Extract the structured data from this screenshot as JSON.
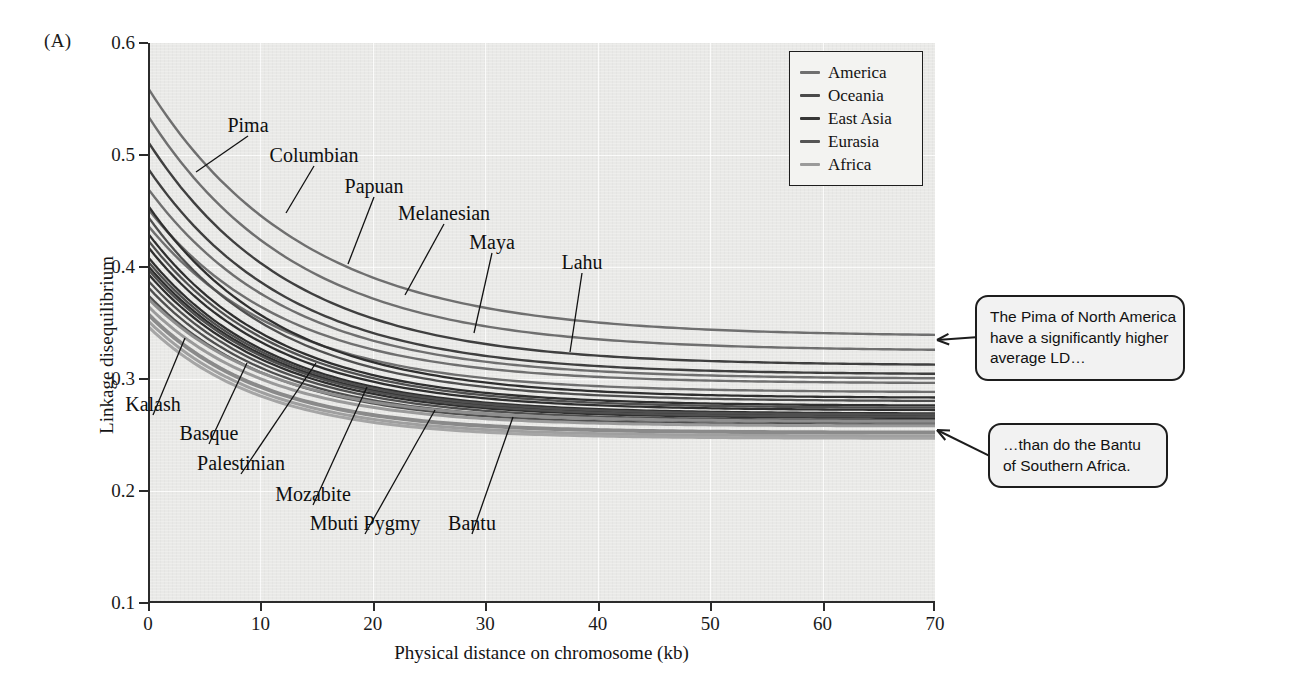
{
  "panel": {
    "letter": "(A)"
  },
  "chart_data": {
    "type": "line",
    "title": "",
    "xlabel": "Physical distance on chromosome (kb)",
    "ylabel": "Linkage disequilibrium",
    "xlim": [
      0,
      70
    ],
    "ylim": [
      0.1,
      0.6
    ],
    "xticks": [
      "0",
      "10",
      "20",
      "30",
      "40",
      "50",
      "60",
      "70"
    ],
    "xtick_values": [
      0,
      10,
      20,
      30,
      40,
      50,
      60,
      70
    ],
    "yticks": [
      "0.1",
      "0.2",
      "0.3",
      "0.4",
      "0.5",
      "0.6"
    ],
    "ytick_values": [
      0.1,
      0.2,
      0.3,
      0.4,
      0.5,
      0.6
    ],
    "grid": true,
    "legend_position": "top-right",
    "legend": [
      {
        "name": "America",
        "color": "#6f6f6f"
      },
      {
        "name": "Oceania",
        "color": "#4a4a4a"
      },
      {
        "name": "East Asia",
        "color": "#363636"
      },
      {
        "name": "Eurasia",
        "color": "#555555"
      },
      {
        "name": "Africa",
        "color": "#9a9a9a"
      }
    ],
    "series": [
      {
        "name": "Pima",
        "group": "America",
        "color": "#6f6f6f",
        "width": 2.4,
        "y0": 0.56,
        "yend": 0.338,
        "k": 0.072
      },
      {
        "name": "Columbian",
        "group": "America",
        "color": "#6f6f6f",
        "width": 2.4,
        "y0": 0.535,
        "yend": 0.325,
        "k": 0.075
      },
      {
        "name": "Maya",
        "group": "America",
        "color": "#6f6f6f",
        "width": 2.4,
        "y0": 0.47,
        "yend": 0.3,
        "k": 0.08
      },
      {
        "name": "Karitiana",
        "group": "America",
        "color": "#6f6f6f",
        "width": 2.4,
        "y0": 0.452,
        "yend": 0.296,
        "k": 0.082
      },
      {
        "name": "Surui",
        "group": "America",
        "color": "#6f6f6f",
        "width": 2.4,
        "y0": 0.437,
        "yend": 0.288,
        "k": 0.082
      },
      {
        "name": "Papuan",
        "group": "Oceania",
        "color": "#3f3f3f",
        "width": 2.4,
        "y0": 0.512,
        "yend": 0.312,
        "k": 0.078
      },
      {
        "name": "Melanesian",
        "group": "Oceania",
        "color": "#3f3f3f",
        "width": 2.4,
        "y0": 0.488,
        "yend": 0.304,
        "k": 0.08
      },
      {
        "name": "Lahu",
        "group": "East Asia",
        "color": "#2f2f2f",
        "width": 2.3,
        "y0": 0.455,
        "yend": 0.283,
        "k": 0.084
      },
      {
        "name": "She",
        "group": "East Asia",
        "color": "#2f2f2f",
        "width": 2.3,
        "y0": 0.43,
        "yend": 0.276,
        "k": 0.086
      },
      {
        "name": "Japanese",
        "group": "East Asia",
        "color": "#2f2f2f",
        "width": 2.3,
        "y0": 0.418,
        "yend": 0.272,
        "k": 0.087
      },
      {
        "name": "Han",
        "group": "East Asia",
        "color": "#2f2f2f",
        "width": 2.3,
        "y0": 0.409,
        "yend": 0.269,
        "k": 0.088
      },
      {
        "name": "Yakut",
        "group": "East Asia",
        "color": "#2f2f2f",
        "width": 2.3,
        "y0": 0.401,
        "yend": 0.267,
        "k": 0.088
      },
      {
        "name": "Cambodian",
        "group": "East Asia",
        "color": "#2f2f2f",
        "width": 2.3,
        "y0": 0.394,
        "yend": 0.265,
        "k": 0.089
      },
      {
        "name": "Kalash",
        "group": "Eurasia",
        "color": "#4f4f4f",
        "width": 2.3,
        "y0": 0.445,
        "yend": 0.28,
        "k": 0.085
      },
      {
        "name": "Basque",
        "group": "Eurasia",
        "color": "#4f4f4f",
        "width": 2.3,
        "y0": 0.424,
        "yend": 0.274,
        "k": 0.086
      },
      {
        "name": "Palestinian",
        "group": "Eurasia",
        "color": "#4f4f4f",
        "width": 2.3,
        "y0": 0.405,
        "yend": 0.268,
        "k": 0.088
      },
      {
        "name": "Sardinian",
        "group": "Eurasia",
        "color": "#4f4f4f",
        "width": 2.3,
        "y0": 0.398,
        "yend": 0.266,
        "k": 0.088
      },
      {
        "name": "Adygei",
        "group": "Eurasia",
        "color": "#4f4f4f",
        "width": 2.3,
        "y0": 0.388,
        "yend": 0.263,
        "k": 0.089
      },
      {
        "name": "Russian",
        "group": "Eurasia",
        "color": "#4f4f4f",
        "width": 2.3,
        "y0": 0.382,
        "yend": 0.261,
        "k": 0.09
      },
      {
        "name": "Druze",
        "group": "Eurasia",
        "color": "#4f4f4f",
        "width": 2.3,
        "y0": 0.375,
        "yend": 0.259,
        "k": 0.09
      },
      {
        "name": "Mozabite",
        "group": "Africa",
        "color": "#8e8e8e",
        "width": 3.0,
        "y0": 0.372,
        "yend": 0.262,
        "k": 0.092
      },
      {
        "name": "Mbuti Pygmy",
        "group": "Africa",
        "color": "#9a9a9a",
        "width": 3.0,
        "y0": 0.365,
        "yend": 0.258,
        "k": 0.093
      },
      {
        "name": "Bantu",
        "group": "Africa",
        "color": "#8a8a8a",
        "width": 4.0,
        "y0": 0.358,
        "yend": 0.252,
        "k": 0.095
      },
      {
        "name": "Yoruba",
        "group": "Africa",
        "color": "#9f9f9f",
        "width": 3.0,
        "y0": 0.352,
        "yend": 0.249,
        "k": 0.096
      },
      {
        "name": "Biaka Pygmy",
        "group": "Africa",
        "color": "#a5a5a5",
        "width": 3.0,
        "y0": 0.347,
        "yend": 0.247,
        "k": 0.097
      }
    ],
    "annotations": [
      {
        "text": "Pima",
        "label_x": 248,
        "label_y": 125,
        "tip_x": 196,
        "tip_y": 172
      },
      {
        "text": "Columbian",
        "label_x": 314,
        "label_y": 155,
        "tip_x": 286,
        "tip_y": 213
      },
      {
        "text": "Papuan",
        "label_x": 374,
        "label_y": 186,
        "tip_x": 348,
        "tip_y": 264
      },
      {
        "text": "Melanesian",
        "label_x": 444,
        "label_y": 213,
        "tip_x": 405,
        "tip_y": 295
      },
      {
        "text": "Maya",
        "label_x": 492,
        "label_y": 242,
        "tip_x": 474,
        "tip_y": 333
      },
      {
        "text": "Lahu",
        "label_x": 582,
        "label_y": 262,
        "tip_x": 570,
        "tip_y": 352
      },
      {
        "text": "Kalash",
        "label_x": 153,
        "label_y": 404,
        "tip_x": 185,
        "tip_y": 338
      },
      {
        "text": "Basque",
        "label_x": 209,
        "label_y": 433,
        "tip_x": 247,
        "tip_y": 363
      },
      {
        "text": "Palestinian",
        "label_x": 241,
        "label_y": 463,
        "tip_x": 316,
        "tip_y": 363
      },
      {
        "text": "Mozabite",
        "label_x": 313,
        "label_y": 494,
        "tip_x": 367,
        "tip_y": 387
      },
      {
        "text": "Mbuti Pygmy",
        "label_x": 365,
        "label_y": 523,
        "tip_x": 435,
        "tip_y": 410
      },
      {
        "text": "Bantu",
        "label_x": 472,
        "label_y": 523,
        "tip_x": 513,
        "tip_y": 417
      }
    ]
  },
  "callouts": [
    {
      "id": "callout-pima",
      "lines": [
        "The Pima of North America",
        "have a significantly higher",
        "average LD…"
      ],
      "box": {
        "x": 975,
        "y": 295,
        "w": 210,
        "h": 80
      },
      "tip": {
        "x": 937,
        "y": 340
      }
    },
    {
      "id": "callout-bantu",
      "lines": [
        "…than do the Bantu",
        "of Southern Africa."
      ],
      "box": {
        "x": 988,
        "y": 423,
        "w": 180,
        "h": 62
      },
      "tip": {
        "x": 937,
        "y": 430
      }
    }
  ]
}
